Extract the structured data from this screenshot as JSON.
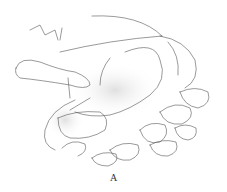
{
  "figure": {
    "label": "A",
    "line_color": "#555555",
    "shade_color": "#cfcfcf"
  }
}
